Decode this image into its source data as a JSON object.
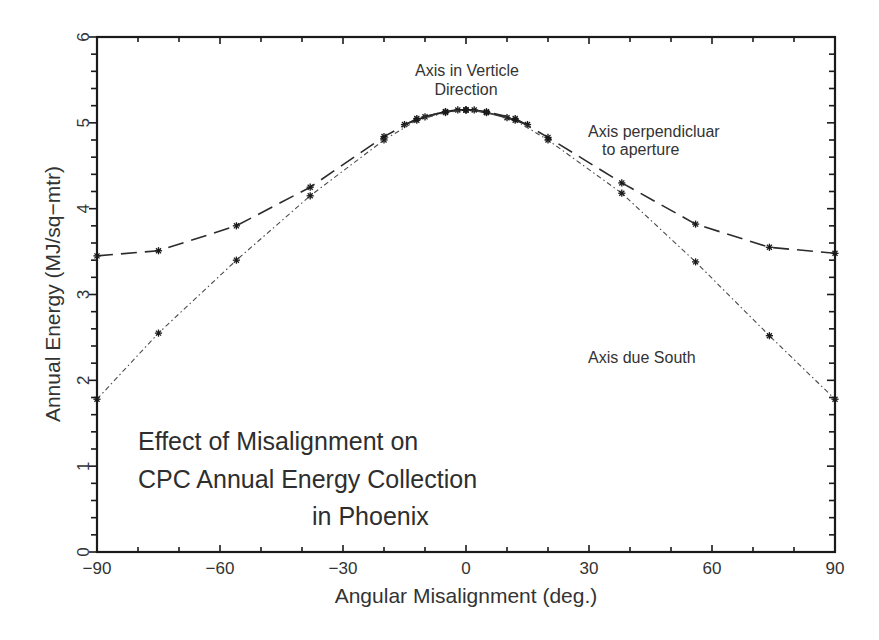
{
  "chart_data": {
    "type": "line",
    "title": "Effect of Misalignment on CPC Annual Energy Collection in Phoenix",
    "title_lines": [
      "Effect of Misalignment on",
      "CPC Annual Energy Collection",
      "in Phoenix"
    ],
    "xlabel": "Angular Misalignment (deg.)",
    "ylabel": "Annual Energy (MJ/sq−mtr)",
    "xlim": [
      -90,
      90
    ],
    "ylim": [
      0,
      6
    ],
    "xticks": [
      -90,
      -60,
      -30,
      0,
      30,
      60,
      90
    ],
    "xtick_labels": [
      "−90",
      "−60",
      "−30",
      "0",
      "30",
      "60",
      "90"
    ],
    "yticks": [
      0,
      1,
      2,
      3,
      4,
      5,
      6
    ],
    "ytick_labels": [
      "0",
      "1",
      "2",
      "3",
      "4",
      "5",
      "6"
    ],
    "grid": false,
    "legend": "none (inline annotations)",
    "series": [
      {
        "name": "Axis in Verticle Direction",
        "style": "solid",
        "x": [
          -15,
          -10,
          -5,
          -2,
          0,
          2,
          5,
          10,
          15
        ],
        "y": [
          4.98,
          5.07,
          5.13,
          5.15,
          5.15,
          5.15,
          5.12,
          5.06,
          4.98
        ]
      },
      {
        "name": "Axis perpendicluar to aperture",
        "style": "dashed",
        "x": [
          -90,
          -75,
          -56,
          -38,
          -20,
          -12,
          -5,
          0,
          5,
          12,
          20,
          38,
          56,
          74,
          90
        ],
        "y": [
          3.45,
          3.51,
          3.8,
          4.25,
          4.84,
          5.05,
          5.13,
          5.15,
          5.13,
          5.05,
          4.83,
          4.3,
          3.82,
          3.55,
          3.48
        ]
      },
      {
        "name": "Axis due South",
        "style": "dash-dot",
        "x": [
          -90,
          -75,
          -56,
          -38,
          -20,
          -12,
          -5,
          0,
          5,
          12,
          20,
          38,
          56,
          74,
          90
        ],
        "y": [
          1.78,
          2.55,
          3.4,
          4.15,
          4.8,
          5.03,
          5.12,
          5.15,
          5.12,
          5.03,
          4.8,
          4.18,
          3.38,
          2.52,
          1.78
        ]
      }
    ],
    "annotations": [
      {
        "text_lines": [
          "Axis in Verticle",
          "Direction"
        ],
        "x": 0,
        "y": 5.55
      },
      {
        "text_lines": [
          "Axis perpendicluar",
          "to aperture"
        ],
        "x": 52,
        "y": 4.7
      },
      {
        "text_lines": [
          "Axis due South"
        ],
        "x": 58,
        "y": 2.05
      }
    ]
  }
}
